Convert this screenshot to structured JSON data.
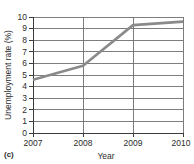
{
  "chart_data": {
    "type": "line",
    "title": "",
    "panel_label": "(c)",
    "xlabel": "Year",
    "ylabel": "Unemployment rate (%)",
    "x": [
      2007,
      2008,
      2009,
      2010
    ],
    "categories": [
      "2007",
      "2008",
      "2009",
      "2010"
    ],
    "values": [
      4.6,
      5.8,
      9.3,
      9.6
    ],
    "series": [
      {
        "name": "Unemployment rate",
        "values": [
          4.6,
          5.8,
          9.3,
          9.6
        ],
        "color": "#8a8a8a"
      }
    ],
    "xlim": [
      2007,
      2010
    ],
    "ylim": [
      0,
      10
    ],
    "ytick_labels": [
      "0",
      "1",
      "2",
      "3",
      "4",
      "5",
      "6",
      "7",
      "8",
      "9",
      "10"
    ],
    "ytick_values": [
      0,
      1,
      2,
      3,
      4,
      5,
      6,
      7,
      8,
      9,
      10
    ],
    "xtick_labels": [
      "2007",
      "2008",
      "2009",
      "2010"
    ],
    "xtick_values": [
      2007,
      2008,
      2009,
      2010
    ],
    "grid": {
      "horizontal": true,
      "vertical": true,
      "color": "#6f6f6f"
    },
    "legend": {
      "visible": false,
      "position": "none"
    },
    "axis_color": "#3b3b3b",
    "background_color": "#ffffff"
  },
  "labels": {
    "y_axis_title": "Unemployment rate (%)",
    "x_axis_title": "Year",
    "caption": "(c)",
    "y_0": "0",
    "y_1": "1",
    "y_2": "2",
    "y_3": "3",
    "y_4": "4",
    "y_5": "5",
    "y_6": "6",
    "y_7": "7",
    "y_8": "8",
    "y_9": "9",
    "y_10": "10",
    "x_2007": "2007",
    "x_2008": "2008",
    "x_2009": "2009",
    "x_2010": "2010"
  }
}
